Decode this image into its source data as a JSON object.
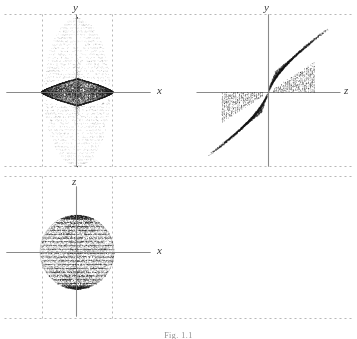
{
  "figure": {
    "width": 357,
    "height": 339,
    "background": "#ffffff",
    "caption_text": "Fig. 1.1",
    "axis_color": "#8a8a8a",
    "dashed_color": "#9a9a9a",
    "point_color": "#1a1a1a"
  },
  "chart_data": {
    "type": "scatter",
    "title": "",
    "panels": [
      {
        "id": "panel-xy",
        "name": "top-left-xy-projection",
        "xlabel": "x",
        "ylabel": "y",
        "origin": [
          76,
          92
        ],
        "x_axis_extent": [
          6,
          150
        ],
        "y_axis_extent": [
          14,
          168
        ],
        "xlim": [
          -1.25,
          1.25
        ],
        "ylim": [
          -1.35,
          1.35
        ],
        "grid": false,
        "bounds_dashed": {
          "vertical_x": [
            42,
            112
          ],
          "horizontal_y": [
            14,
            166
          ],
          "horizontal_full_width": true
        },
        "clusters": [
          {
            "name": "sparse-vertical-ellipse",
            "shape": "ellipse",
            "n_points": 2600,
            "cx": 77,
            "cy": 92,
            "rx": 33,
            "ry": 74,
            "density": "sparse",
            "dot_size": 0.55,
            "opacity": 0.55,
            "radial_bias": 1.0,
            "striated": true,
            "stripe_count": 46
          },
          {
            "name": "dense-lens-core",
            "shape": "lens",
            "n_points": 5200,
            "cx": 77,
            "cy": 92,
            "rx": 36,
            "ry": 14,
            "density": "dense",
            "dot_size": 0.62,
            "opacity": 0.95,
            "radial_bias": 0.45
          },
          {
            "name": "core-vertical-spike",
            "shape": "ellipse",
            "n_points": 520,
            "cx": 77,
            "cy": 92,
            "rx": 4.5,
            "ry": 34,
            "density": "medium",
            "dot_size": 0.55,
            "opacity": 0.7,
            "radial_bias": 0.7
          }
        ]
      },
      {
        "id": "panel-zy",
        "name": "top-right-zy-projection",
        "xlabel": "z",
        "ylabel": "y",
        "origin": [
          268,
          92
        ],
        "x_axis_extent": [
          196,
          340
        ],
        "y_axis_extent": [
          14,
          168
        ],
        "xlim": [
          -1.25,
          1.25
        ],
        "ylim": [
          -1.35,
          1.35
        ],
        "grid": false,
        "bounds_dashed": {
          "horizontal_y": [
            14,
            166
          ],
          "horizontal_full_width": true
        },
        "clusters": [
          {
            "name": "upper-right-fan-wedge",
            "shape": "fan",
            "n_points": 2500,
            "ox": 268,
            "oy": 92,
            "dir_x": 1,
            "dir_y": -1,
            "length": 72,
            "width": 42,
            "arc_count": 26,
            "dot_size": 0.58,
            "opacity": 0.85
          },
          {
            "name": "lower-left-fan-wedge",
            "shape": "fan",
            "n_points": 2500,
            "ox": 268,
            "oy": 92,
            "dir_x": -1,
            "dir_y": 1,
            "length": 72,
            "width": 42,
            "arc_count": 26,
            "dot_size": 0.58,
            "opacity": 0.85
          }
        ]
      },
      {
        "id": "panel-xz",
        "name": "bottom-left-xz-projection",
        "xlabel": "x",
        "ylabel": "z",
        "origin": [
          76,
          252
        ],
        "x_axis_extent": [
          6,
          150
        ],
        "y_axis_extent": [
          186,
          318
        ],
        "xlim": [
          -1.25,
          1.25
        ],
        "ylim": [
          -1.2,
          1.2
        ],
        "grid": false,
        "bounds_dashed": {
          "vertical_x": [
            42,
            112
          ],
          "horizontal_y": [
            176
          ],
          "horizontal_full_width": true
        },
        "clusters": [
          {
            "name": "banded-disk",
            "shape": "disk",
            "n_points": 7200,
            "cx": 77,
            "cy": 252,
            "rx": 37,
            "ry": 37,
            "density": "dense",
            "dot_size": 0.6,
            "opacity": 0.9,
            "striated": true,
            "stripe_count": 40,
            "cap_darkening": true
          }
        ]
      }
    ]
  },
  "labels": {
    "panel_xy_x": {
      "text": "x",
      "left": 157,
      "top": 85
    },
    "panel_xy_y": {
      "text": "y",
      "left": 73,
      "top": 2
    },
    "panel_zy_z": {
      "text": "z",
      "left": 344,
      "top": 85
    },
    "panel_zy_y": {
      "text": "y",
      "left": 264,
      "top": 2
    },
    "panel_xz_x": {
      "text": "x",
      "left": 157,
      "top": 245
    },
    "panel_xz_z": {
      "text": "z",
      "left": 72,
      "top": 176
    }
  }
}
